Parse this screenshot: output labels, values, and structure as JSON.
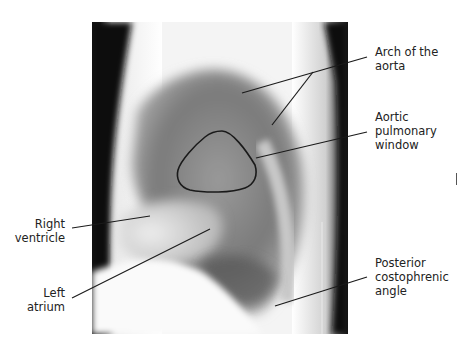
{
  "figure": {
    "type": "lateral chest radiograph with anatomical labels"
  },
  "labels": {
    "arch_of_aorta": [
      "Arch of the",
      "aorta"
    ],
    "aortic_pulmonary_window": [
      "Aortic",
      "pulmonary",
      "window"
    ],
    "right_ventricle": [
      "Right",
      "ventricle"
    ],
    "left_atrium": [
      "Left",
      "atrium"
    ],
    "posterior_costophrenic_angle": [
      "Posterior",
      "costophrenic",
      "angle"
    ]
  },
  "colors": {
    "line": "#1a1a1a",
    "text": "#222222",
    "background": "#ffffff"
  }
}
